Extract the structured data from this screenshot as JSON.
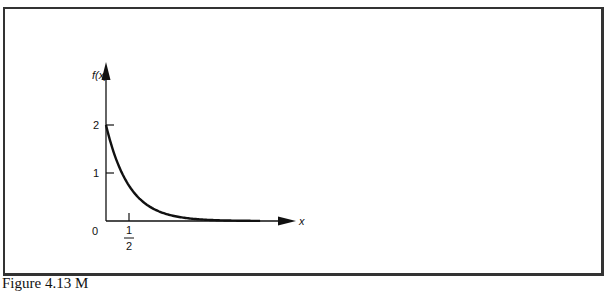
{
  "chart_data": {
    "type": "line",
    "title": "",
    "xlabel": "x",
    "ylabel": "f(x)",
    "function": "f(x) = 2e^(-2x)",
    "x": [
      0,
      0.25,
      0.5,
      0.75,
      1.0,
      1.5,
      2.0,
      2.5,
      3.0,
      3.35
    ],
    "series": [
      {
        "name": "f(x)",
        "values": [
          2.0,
          1.213,
          0.736,
          0.446,
          0.271,
          0.1,
          0.037,
          0.013,
          0.005,
          0.002
        ]
      }
    ],
    "x_ticks": [
      {
        "value": 0.5,
        "label": "1/2"
      }
    ],
    "y_ticks": [
      {
        "value": 1,
        "label": "1"
      },
      {
        "value": 2,
        "label": "2"
      }
    ],
    "origin_label": "0",
    "xlim": [
      0,
      3.6
    ],
    "ylim": [
      0,
      2.9
    ],
    "grid": false,
    "legend": null
  },
  "labels": {
    "y_axis": "f(x)",
    "x_axis": "x",
    "origin": "0",
    "ytick_1": "1",
    "ytick_2": "2",
    "xtick_num": "1",
    "xtick_den": "2"
  },
  "caption": "Figure 4.13  M"
}
